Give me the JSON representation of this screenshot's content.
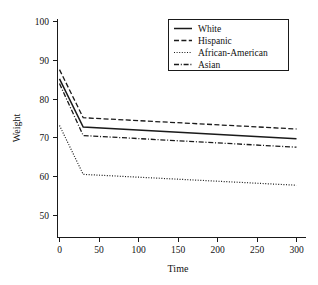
{
  "chart_data": {
    "type": "line",
    "title": "",
    "xlabel": "Time",
    "ylabel": "Weight",
    "xlim": [
      -8,
      312
    ],
    "ylim": [
      44,
      103
    ],
    "xticks": [
      0,
      50,
      100,
      150,
      200,
      250,
      300
    ],
    "yticks": [
      50,
      60,
      70,
      80,
      90,
      100
    ],
    "xtick_labels": [
      "0",
      "50",
      "100",
      "150",
      "200",
      "250",
      "300"
    ],
    "ytick_labels": [
      "50",
      "60",
      "70",
      "80",
      "90",
      "100"
    ],
    "grid": false,
    "legend_position": "top-right",
    "x": [
      0,
      30,
      300
    ],
    "series": [
      {
        "name": "White",
        "linestyle": "solid",
        "color": "#1a1a1a",
        "values": [
          85.2,
          72.8,
          69.8
        ]
      },
      {
        "name": "Hispanic",
        "linestyle": "dashed",
        "color": "#1a1a1a",
        "values": [
          87.6,
          75.2,
          72.3
        ]
      },
      {
        "name": "African-American",
        "linestyle": "dotted",
        "color": "#1a1a1a",
        "values": [
          73.2,
          60.6,
          57.8
        ]
      },
      {
        "name": "Asian",
        "linestyle": "dashdot",
        "color": "#1a1a1a",
        "values": [
          84.0,
          70.6,
          67.6
        ]
      }
    ]
  },
  "legend": {
    "entries": [
      {
        "label": "White"
      },
      {
        "label": "Hispanic"
      },
      {
        "label": "African-American"
      },
      {
        "label": "Asian"
      }
    ]
  },
  "colors": {
    "ink": "#1a1a1a",
    "background": "#ffffff"
  }
}
